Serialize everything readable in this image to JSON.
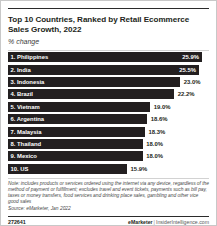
{
  "chart_data": {
    "type": "bar",
    "title": "Top 10 Countries, Ranked by Retail Ecommerce Sales Growth, 2022",
    "subtitle": "% change",
    "xlabel": "",
    "ylabel": "",
    "orientation": "horizontal",
    "grid": false,
    "legend": false,
    "xlim": [
      0,
      25.9
    ],
    "categories": [
      "1. Philippines",
      "2. India",
      "3. Indonesia",
      "4. Brazil",
      "5. Vietnam",
      "6. Argentina",
      "7. Malaysia",
      "8. Thailand",
      "9. Mexico",
      "10. US"
    ],
    "values": [
      25.9,
      25.5,
      23.0,
      22.2,
      19.0,
      18.6,
      18.3,
      18.0,
      18.0,
      15.9
    ],
    "value_labels": [
      "25.9%",
      "25.5%",
      "23.0%",
      "22.2%",
      "19.0%",
      "18.6%",
      "18.3%",
      "18.0%",
      "18.0%",
      "15.9%"
    ],
    "label_inside": [
      true,
      true,
      false,
      false,
      false,
      false,
      false,
      false,
      false,
      false
    ],
    "bar_color": "#231f20",
    "note": "Note: includes products or services ordered using the internet via any device, regardless of the method of payment or fulfillment; excludes travel and event tickets, payments such as bill pay, taxes or money transfers, food services and drinking place sales, gambling and other vice good sales",
    "source": "Source: eMarketer, Jan 2022"
  },
  "footer": {
    "id": "272641",
    "brand": "eMarketer",
    "separator": "|",
    "site": "InsiderIntelligence.com"
  }
}
